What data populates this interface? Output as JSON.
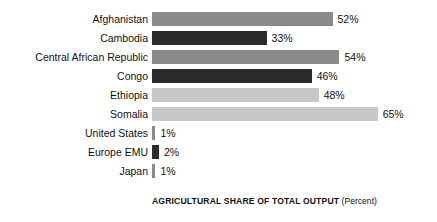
{
  "chart_data": {
    "type": "bar",
    "orientation": "horizontal",
    "title": "",
    "xlabel": "AGRICULTURAL SHARE OF TOTAL OUTPUT",
    "xlabel_unit": "(Percent)",
    "ylabel": "COUNTRY",
    "xlim": [
      0,
      70
    ],
    "grid": false,
    "legend": false,
    "categories": [
      "Afghanistan",
      "Cambodia",
      "Central African Republic",
      "Congo",
      "Ethiopia",
      "Somalia",
      "United States",
      "Europe EMU",
      "Japan"
    ],
    "values": [
      52,
      33,
      54,
      46,
      48,
      65,
      1,
      2,
      1
    ],
    "value_labels": [
      "52%",
      "33%",
      "54%",
      "46%",
      "48%",
      "65%",
      "1%",
      "2%",
      "1%"
    ],
    "bar_colors": [
      "#8a8a8a",
      "#2b2b2b",
      "#8a8a8a",
      "#2b2b2b",
      "#c8c8c8",
      "#c8c8c8",
      "#8a8a8a",
      "#2b2b2b",
      "#8a8a8a"
    ]
  },
  "axis": {
    "y_title": "COUNTRY",
    "x_title_main": "AGRICULTURAL SHARE OF TOTAL OUTPUT",
    "x_title_unit": "(Percent)"
  }
}
